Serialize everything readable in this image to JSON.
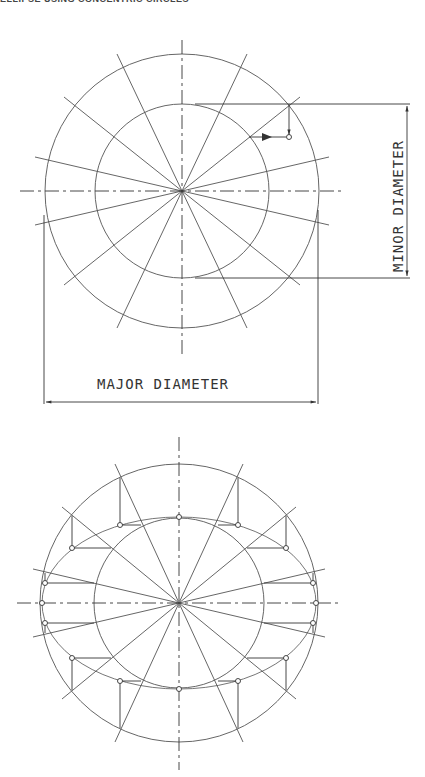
{
  "header": {
    "title": "ELLIPSE USING CONCENTRIC CIRCLES"
  },
  "figure_top": {
    "center": [
      182,
      191
    ],
    "outer_radius": 137,
    "inner_radius": 87,
    "spoke_count": 12,
    "labels": {
      "major": "MAJOR DIAMETER",
      "minor": "MINOR DIAMETER"
    }
  },
  "figure_bottom": {
    "center": [
      179,
      603
    ],
    "outer_radius": 139,
    "inner_radius": 85,
    "ellipse_rx": 137,
    "ellipse_ry": 86,
    "spoke_count": 12
  },
  "colors": {
    "line": "#555555",
    "dark": "#222222",
    "background": "#ffffff"
  }
}
